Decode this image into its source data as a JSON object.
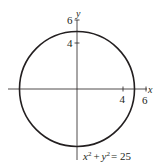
{
  "figure": {
    "type": "circle-graph",
    "equation": {
      "x_term": "x",
      "x_exp": "2",
      "plus": "+",
      "y_term": "y",
      "y_exp": "2",
      "equals": "= 25"
    },
    "axes": {
      "x_label": "x",
      "y_label": "y",
      "x_ticks": [
        {
          "value": 4,
          "label": "4"
        },
        {
          "value": 6,
          "label": "6"
        }
      ],
      "y_ticks": [
        {
          "value": 4,
          "label": "4"
        },
        {
          "value": 6,
          "label": "6"
        }
      ]
    },
    "circle": {
      "center": [
        0,
        0
      ],
      "radius": 5
    },
    "colors": {
      "stroke": "#231f20",
      "axis": "#231f20",
      "background": "#ffffff"
    }
  }
}
